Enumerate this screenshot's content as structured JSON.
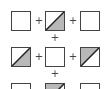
{
  "diagram": {
    "operator": "+",
    "colors": {
      "border": "#444444",
      "fill": "#ffffff",
      "shade": "#b8b8b8",
      "diagonal": "#222222"
    },
    "rows": [
      {
        "tiles": [
          "blank",
          "shade-lower-right",
          "blank"
        ]
      },
      {
        "tiles": [
          "shade-lower-right",
          "blank",
          "shade-upper-left"
        ]
      },
      {
        "tiles": [
          "blank",
          "shade-upper-left",
          "blank"
        ]
      }
    ]
  }
}
